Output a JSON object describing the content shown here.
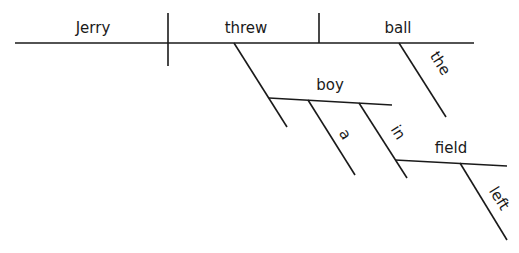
{
  "diagram": {
    "type": "sentence-diagram",
    "sentence_words": {
      "subject": "Jerry",
      "verb": "threw",
      "object": "ball",
      "object_modifier": "the",
      "indirect_object": "boy",
      "indirect_object_modifier": "a",
      "preposition": "in",
      "prepositional_object": "field",
      "prepositional_object_modifier": "left"
    }
  }
}
